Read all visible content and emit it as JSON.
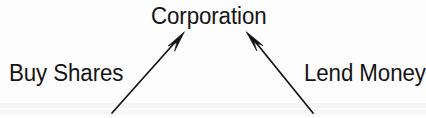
{
  "diagram": {
    "type": "node-arrow-diagram",
    "canvas": {
      "width": 426,
      "height": 118
    },
    "background_color": "#fdfdfd",
    "ink_color": "#141414",
    "nodes": [
      {
        "id": "corporation",
        "label": "Corporation",
        "role": "target",
        "position": {
          "x": 151,
          "y": 5
        }
      },
      {
        "id": "buy-shares",
        "label": "Buy Shares",
        "role": "source",
        "position": {
          "x": 9,
          "y": 62
        }
      },
      {
        "id": "lend-money",
        "label": "Lend Money",
        "role": "source",
        "position": {
          "x": 304,
          "y": 62
        }
      }
    ],
    "arrows": [
      {
        "id": "arrow-buy-shares-to-corporation",
        "from": "buy-shares",
        "to": "corporation",
        "direction": "up-right",
        "tail": {
          "x": 112,
          "y": 113
        },
        "tip": {
          "x": 184,
          "y": 32
        }
      },
      {
        "id": "arrow-lend-money-to-corporation",
        "from": "lend-money",
        "to": "corporation",
        "direction": "up-left",
        "tail": {
          "x": 313,
          "y": 113
        },
        "tip": {
          "x": 246,
          "y": 32
        }
      }
    ]
  }
}
